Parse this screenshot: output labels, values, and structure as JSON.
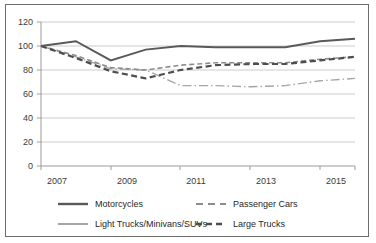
{
  "chart_data": {
    "type": "line",
    "title": "",
    "subtitle": "",
    "xlabel": "",
    "ylabel": "",
    "x": [
      2007,
      2008,
      2009,
      2010,
      2011,
      2012,
      2013,
      2014,
      2015,
      2016
    ],
    "xlim": [
      2007,
      2016
    ],
    "ylim": [
      0,
      120
    ],
    "yticks": [
      0,
      20,
      40,
      60,
      80,
      100,
      120
    ],
    "ytick_labels": [
      "0",
      "20",
      "40",
      "60",
      "80",
      "100",
      "120"
    ],
    "xticks": [
      2007,
      2009,
      2011,
      2013,
      2015
    ],
    "xtick_labels": [
      "2007",
      "2009",
      "2011",
      "2013",
      "2015"
    ],
    "grid": "horizontal",
    "legend_position": "bottom",
    "series": [
      {
        "name": "Motorcycles",
        "style": "solid",
        "color": "#595959",
        "values": [
          100,
          104,
          88,
          97,
          100,
          99,
          99,
          99,
          104,
          106
        ]
      },
      {
        "name": "Passenger Cars",
        "style": "dashed",
        "color": "#808080",
        "values": [
          100,
          92,
          82,
          80,
          84,
          86,
          86,
          86,
          89,
          91
        ]
      },
      {
        "name": "Light Trucks/Minivans/SUVs",
        "style": "solid-light",
        "color": "#a6a6a6",
        "values": [
          100,
          91,
          81,
          80,
          67,
          67,
          66,
          67,
          71,
          73
        ]
      },
      {
        "name": "Large Trucks",
        "style": "dashed-heavy",
        "color": "#4d4d4d",
        "values": [
          100,
          90,
          79,
          73,
          80,
          84,
          85,
          85,
          88,
          91
        ]
      }
    ]
  },
  "axes": {
    "y_ticks": [
      "120",
      "100",
      "80",
      "60",
      "40",
      "20",
      "0"
    ],
    "x_ticks": [
      "2007",
      "2009",
      "2011",
      "2013",
      "2015"
    ]
  },
  "legend": {
    "items": [
      {
        "label": "Motorcycles"
      },
      {
        "label": "Passenger Cars"
      },
      {
        "label": "Light Trucks/Minivans/SUVs"
      },
      {
        "label": "Large Trucks"
      }
    ]
  }
}
